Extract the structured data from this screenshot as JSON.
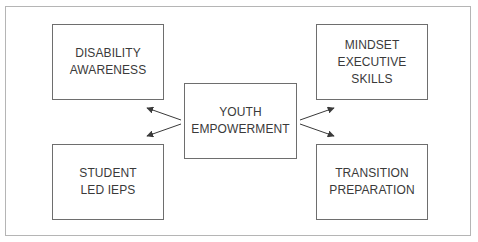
{
  "diagram": {
    "center": {
      "label": "YOUTH\nEMPOWERMENT"
    },
    "nodes": [
      {
        "id": "disability",
        "label": "DISABILITY\nAWARENESS",
        "position": "top-left"
      },
      {
        "id": "mindset",
        "label": "MINDSET\nEXECUTIVE\nSKILLS",
        "position": "top-right"
      },
      {
        "id": "student",
        "label": "STUDENT\nLED IEPS",
        "position": "bottom-left"
      },
      {
        "id": "transition",
        "label": "TRANSITION\nPREPARATION",
        "position": "bottom-right"
      }
    ],
    "edges": [
      {
        "from": "center",
        "to": "disability"
      },
      {
        "from": "center",
        "to": "student"
      },
      {
        "from": "center",
        "to": "mindset"
      },
      {
        "from": "center",
        "to": "transition"
      }
    ],
    "colors": {
      "border": "#6e6e6e",
      "frame": "#b5b5b5",
      "text": "#3a3a3a",
      "arrow": "#3a3a3a"
    }
  }
}
